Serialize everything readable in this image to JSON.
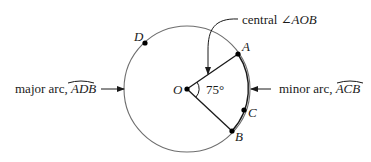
{
  "diagram": {
    "center": {
      "label": "O"
    },
    "points": {
      "A": {
        "label": "A"
      },
      "B": {
        "label": "B"
      },
      "C": {
        "label": "C"
      },
      "D": {
        "label": "D"
      }
    },
    "angle": {
      "value": "75°"
    },
    "callouts": {
      "central_angle": {
        "prefix": "central ",
        "symbol": "∠",
        "name": "AOB"
      },
      "major_arc": {
        "prefix": "major arc, ",
        "name": "ADB"
      },
      "minor_arc": {
        "prefix": "minor arc, ",
        "name": "ACB"
      }
    }
  }
}
